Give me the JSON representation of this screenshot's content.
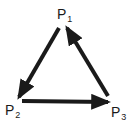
{
  "diagram": {
    "type": "cycle",
    "stroke_color": "#1a1a1a",
    "background": "#ffffff",
    "nodes": [
      {
        "id": "P1",
        "base": "P",
        "sub": "1",
        "x": 57,
        "y": 7
      },
      {
        "id": "P2",
        "base": "P",
        "sub": "2",
        "x": 5,
        "y": 103
      },
      {
        "id": "P3",
        "base": "P",
        "sub": "3",
        "x": 111,
        "y": 105
      }
    ],
    "edges": [
      {
        "from": "P1",
        "to": "P2",
        "x1": 59,
        "y1": 28,
        "x2": 19,
        "y2": 97
      },
      {
        "from": "P2",
        "to": "P3",
        "x1": 22,
        "y1": 101,
        "x2": 108,
        "y2": 102
      },
      {
        "from": "P3",
        "to": "P1",
        "x1": 108,
        "y1": 96,
        "x2": 67,
        "y2": 28
      }
    ]
  }
}
